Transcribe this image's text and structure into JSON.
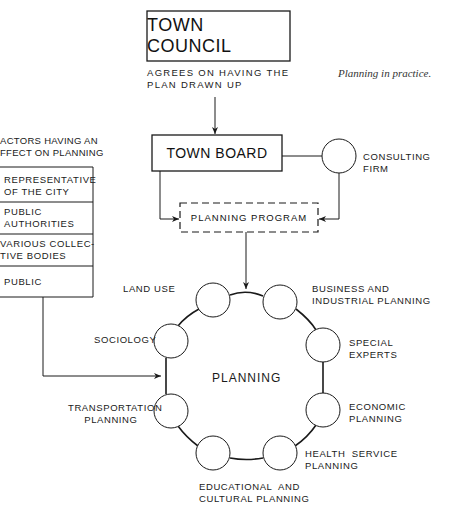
{
  "caption": "Planning in practice.",
  "town_council": {
    "title": "TOWN COUNCIL",
    "note": "AGREES ON HAVING THE\nPLAN DRAWN UP"
  },
  "town_board": {
    "title": "TOWN BOARD"
  },
  "consulting_firm": {
    "label": "CONSULTING\nFIRM"
  },
  "planning_program": {
    "title": "PLANNING  PROGRAM"
  },
  "factors": {
    "heading": "ACTORS HAVING AN\nFFECT ON PLANNING",
    "rows": [
      "REPRESENTATIVE\nOF THE CITY",
      "PUBLIC\nAUTHORITIES",
      "VARIOUS COLLEC-\nTIVE BODIES",
      "PUBLIC"
    ]
  },
  "planning_ring": {
    "center_label": "PLANNING",
    "nodes": [
      {
        "label": "LAND USE"
      },
      {
        "label": "BUSINESS AND\nINDUSTRIAL PLANNING"
      },
      {
        "label": "SOCIOLOGY"
      },
      {
        "label": "SPECIAL\nEXPERTS"
      },
      {
        "label": "TRANSPORTATION\n     PLANNING"
      },
      {
        "label": "ECONOMIC\nPLANNING"
      },
      {
        "label": "EDUCATIONAL  AND\nCULTURAL PLANNING"
      },
      {
        "label": "HEALTH  SERVICE\nPLANNING"
      }
    ]
  },
  "colors": {
    "line": "#1a1a1a",
    "background": "#ffffff"
  }
}
